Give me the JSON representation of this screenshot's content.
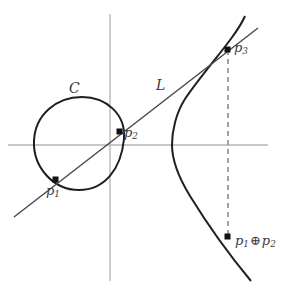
{
  "figure": {
    "colors": {
      "curve": "#1f1f1f",
      "line": "#4a4a4a",
      "axis": "#b4b4b4",
      "dashed": "#8c8c8c",
      "point": "#111111",
      "label": "#3a3a3a",
      "background": "#ffffff"
    }
  },
  "labels": {
    "curve": "C",
    "line": "L",
    "p1": "p",
    "p1_sub": "1",
    "p2": "p",
    "p2_sub": "2",
    "p3": "p",
    "p3_sub": "3",
    "sum_left": "p",
    "sum_left_sub": "1",
    "sum_op": "⊕",
    "sum_right": "p",
    "sum_right_sub": "2"
  },
  "geometry": {
    "axes": {
      "x_axis": {
        "x1": 8,
        "y1": 145,
        "x2": 268,
        "y2": 145
      },
      "y_axis": {
        "x1": 110,
        "y1": 14,
        "x2": 110,
        "y2": 281
      }
    },
    "oval": {
      "description": "closed oval component of the cubic",
      "path": "M 124 139 C 126 114 106 97 82 97 C 56 97 35 115 34 141 C 33 167 53 190 79 190 C 104 190 121 170 124 139 Z"
    },
    "branch": {
      "description": "unbounded branch of the cubic",
      "path": "M 245 16 C 236 37 206 68 185 99 C 176 113 172 131 172 145 C 172 161 179 178 190 196 C 206 222 231 257 251 281"
    },
    "secant_line": {
      "description": "line L through p1, p2 and p3",
      "x1": 14,
      "y1": 217,
      "x2": 258,
      "y2": 28
    },
    "vertical_dashed": {
      "description": "vertical line from p3 down to p1 + p2",
      "x1": 228,
      "y1": 50,
      "x2": 228,
      "y2": 238
    },
    "points": {
      "p1": {
        "x": 56,
        "y": 180
      },
      "p2": {
        "x": 120,
        "y": 132
      },
      "p3": {
        "x": 228,
        "y": 50
      },
      "sum": {
        "x": 228,
        "y": 237
      }
    }
  }
}
